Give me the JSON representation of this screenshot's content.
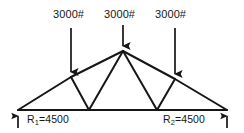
{
  "figure": {
    "stroke_color": "#161616",
    "background_color": "#ffffff"
  },
  "loads": [
    {
      "id": "load-left",
      "label": "3000#",
      "magnitude": 3000,
      "unit": "#",
      "direction": "down",
      "applied_at": "left-top-chord-joint"
    },
    {
      "id": "load-center",
      "label": "3000#",
      "magnitude": 3000,
      "unit": "#",
      "direction": "down",
      "applied_at": "apex-joint"
    },
    {
      "id": "load-right",
      "label": "3000#",
      "magnitude": 3000,
      "unit": "#",
      "direction": "down",
      "applied_at": "right-top-chord-joint"
    }
  ],
  "reactions": [
    {
      "id": "reaction-left",
      "name": "R",
      "subscript": "1",
      "equals": "=",
      "value": "4500",
      "label": "R1=4500",
      "direction": "up"
    },
    {
      "id": "reaction-right",
      "name": "R",
      "subscript": "2",
      "equals": "=",
      "value": "4500",
      "label": "R2=4500",
      "direction": "up"
    }
  ],
  "geometry": {
    "joints": {
      "left_support": [
        18,
        110
      ],
      "left_top": [
        71,
        77
      ],
      "apex": [
        123,
        51
      ],
      "right_top": [
        175,
        79
      ],
      "right_support": [
        227,
        110
      ],
      "bottom_left": [
        89,
        110
      ],
      "bottom_right": [
        157,
        110
      ]
    },
    "members": [
      [
        "left_support",
        "left_top"
      ],
      [
        "left_top",
        "apex"
      ],
      [
        "apex",
        "right_top"
      ],
      [
        "right_top",
        "right_support"
      ],
      [
        "left_support",
        "right_support"
      ],
      [
        "left_top",
        "bottom_left"
      ],
      [
        "bottom_left",
        "apex"
      ],
      [
        "apex",
        "bottom_right"
      ],
      [
        "bottom_right",
        "right_top"
      ]
    ],
    "load_arrows": [
      {
        "id": "arrow-load-left",
        "x": 71,
        "y_start": 28,
        "y_end": 77
      },
      {
        "id": "arrow-load-center",
        "x": 123,
        "y_start": 25,
        "y_end": 51
      },
      {
        "id": "arrow-load-right",
        "x": 175,
        "y_start": 28,
        "y_end": 79
      }
    ],
    "reaction_arrows": [
      {
        "id": "arrow-reaction-left",
        "x": 18,
        "y_start": 128,
        "y_end": 111
      },
      {
        "id": "arrow-reaction-right",
        "x": 227,
        "y_start": 128,
        "y_end": 111
      }
    ]
  }
}
